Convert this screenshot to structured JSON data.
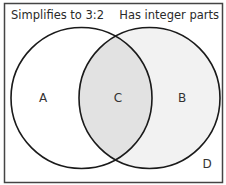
{
  "diagram": {
    "type": "venn",
    "sets": [
      {
        "id": "left",
        "label": "Simplifies to 3:2",
        "fill": "#ffffff"
      },
      {
        "id": "right",
        "label": "Has integer parts",
        "fill": "#f2f2f2"
      }
    ],
    "intersection_fill": "#e2e2e2",
    "stroke": "#1a1a1a",
    "regions": {
      "a": "A",
      "b": "B",
      "c": "C",
      "d": "D"
    }
  }
}
